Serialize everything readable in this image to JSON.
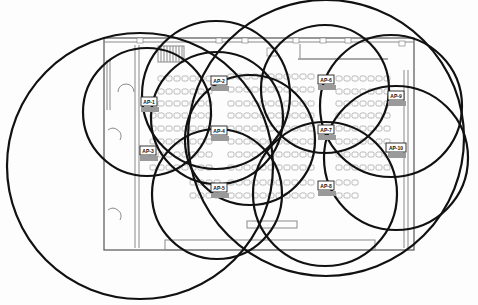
{
  "diagram": {
    "type": "wifi-coverage-floor-plan",
    "access_points": [
      {
        "id": "AP-1",
        "label": "AP-1",
        "x": 149,
        "y": 101
      },
      {
        "id": "AP-2",
        "label": "AP-2",
        "x": 219,
        "y": 80
      },
      {
        "id": "AP-3",
        "label": "AP-3",
        "x": 148,
        "y": 150
      },
      {
        "id": "AP-4",
        "label": "AP-4",
        "x": 219,
        "y": 130
      },
      {
        "id": "AP-5",
        "label": "AP-5",
        "x": 219,
        "y": 187
      },
      {
        "id": "AP-6",
        "label": "AP-6",
        "x": 326,
        "y": 79
      },
      {
        "id": "AP-7",
        "label": "AP-7",
        "x": 326,
        "y": 129
      },
      {
        "id": "AP-8",
        "label": "AP-8",
        "x": 326,
        "y": 185
      },
      {
        "id": "AP-9",
        "label": "AP-9",
        "x": 396,
        "y": 95
      },
      {
        "id": "AP-10",
        "label": "AP-10",
        "x": 396,
        "y": 147
      }
    ],
    "coverage_circles": [
      {
        "cx": 140,
        "cy": 166,
        "r": 133
      },
      {
        "cx": 147,
        "cy": 112,
        "r": 64
      },
      {
        "cx": 216,
        "cy": 95,
        "r": 74
      },
      {
        "cx": 217,
        "cy": 118,
        "r": 66
      },
      {
        "cx": 250,
        "cy": 140,
        "r": 65
      },
      {
        "cx": 217,
        "cy": 194,
        "r": 65
      },
      {
        "cx": 326,
        "cy": 138,
        "r": 138
      },
      {
        "cx": 325,
        "cy": 89,
        "r": 64
      },
      {
        "cx": 391,
        "cy": 106,
        "r": 71
      },
      {
        "cx": 396,
        "cy": 158,
        "r": 72
      },
      {
        "cx": 325,
        "cy": 194,
        "r": 72
      }
    ],
    "colors": {
      "circle_stroke": "#111111",
      "floorplan_line": "#8a8a8a",
      "background": "#fdfdfd"
    }
  }
}
